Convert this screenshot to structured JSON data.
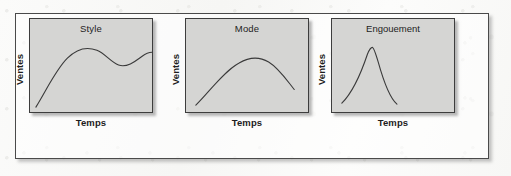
{
  "figure": {
    "background_color": "#fdfdfc",
    "frame_border_color": "#4a4a4a",
    "panel_fill_color": "#d5d5d3",
    "panel_border_color": "#3d3d3d",
    "curve_color": "#3a3a3a"
  },
  "panels": [
    {
      "title": "Style",
      "y_label": "Ventes",
      "x_label": "Temps",
      "curve_path": "M 6 90 C 16 74, 26 52, 38 40 C 48 30, 58 28, 68 32 C 76 35, 82 44, 90 47 C 98 50, 106 44, 114 38 C 118 35, 121 34, 124 34"
    },
    {
      "title": "Mode",
      "y_label": "Ventes",
      "x_label": "Temps",
      "curve_path": "M 10 88 C 24 74, 38 54, 54 45 C 64 39, 74 38, 84 44 C 94 50, 102 62, 110 72"
    },
    {
      "title": "Engouement",
      "y_label": "Ventes",
      "x_label": "Temps",
      "curve_path": "M 10 86 C 18 78, 28 60, 36 36 C 38 31, 40 29, 41 29 C 42 29, 44 34, 47 44 C 52 62, 58 80, 66 87"
    }
  ],
  "chart_data": {
    "type": "line",
    "title": "",
    "xlabel": "Temps",
    "ylabel": "Ventes",
    "grid": false,
    "legend_position": "none",
    "panels": [
      {
        "name": "Style",
        "description": "Rises steeply, peaks, dips to a trough, rises again and levels off — recurring cycles at a sustained level",
        "x": [
          0,
          10,
          20,
          30,
          40,
          50,
          60,
          70,
          80,
          90,
          100
        ],
        "y": [
          0,
          22,
          48,
          68,
          76,
          74,
          68,
          66,
          72,
          78,
          78
        ]
      },
      {
        "name": "Mode",
        "description": "Smooth inverted-U: gradual rise to a rounded peak then gradual decline",
        "x": [
          0,
          10,
          20,
          30,
          40,
          50,
          60,
          70,
          80,
          90,
          100
        ],
        "y": [
          8,
          22,
          36,
          50,
          60,
          65,
          64,
          58,
          48,
          36,
          22
        ]
      },
      {
        "name": "Engouement",
        "description": "Sharp narrow spike: very rapid rise to a high peak followed by an equally rapid collapse",
        "x": [
          0,
          10,
          20,
          25,
          30,
          35,
          40,
          50,
          60,
          80,
          100
        ],
        "y": [
          6,
          20,
          52,
          74,
          88,
          70,
          48,
          20,
          8,
          4,
          3
        ]
      }
    ]
  }
}
